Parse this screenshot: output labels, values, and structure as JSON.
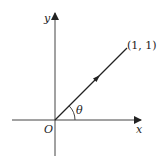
{
  "diagram": {
    "axes": {
      "x_label": "x",
      "y_label": "y",
      "origin_label": "O"
    },
    "vector": {
      "endpoint_label": "(1, 1)",
      "angle_label": "θ"
    },
    "colors": {
      "ink": "#222222",
      "background": "#ffffff"
    }
  }
}
